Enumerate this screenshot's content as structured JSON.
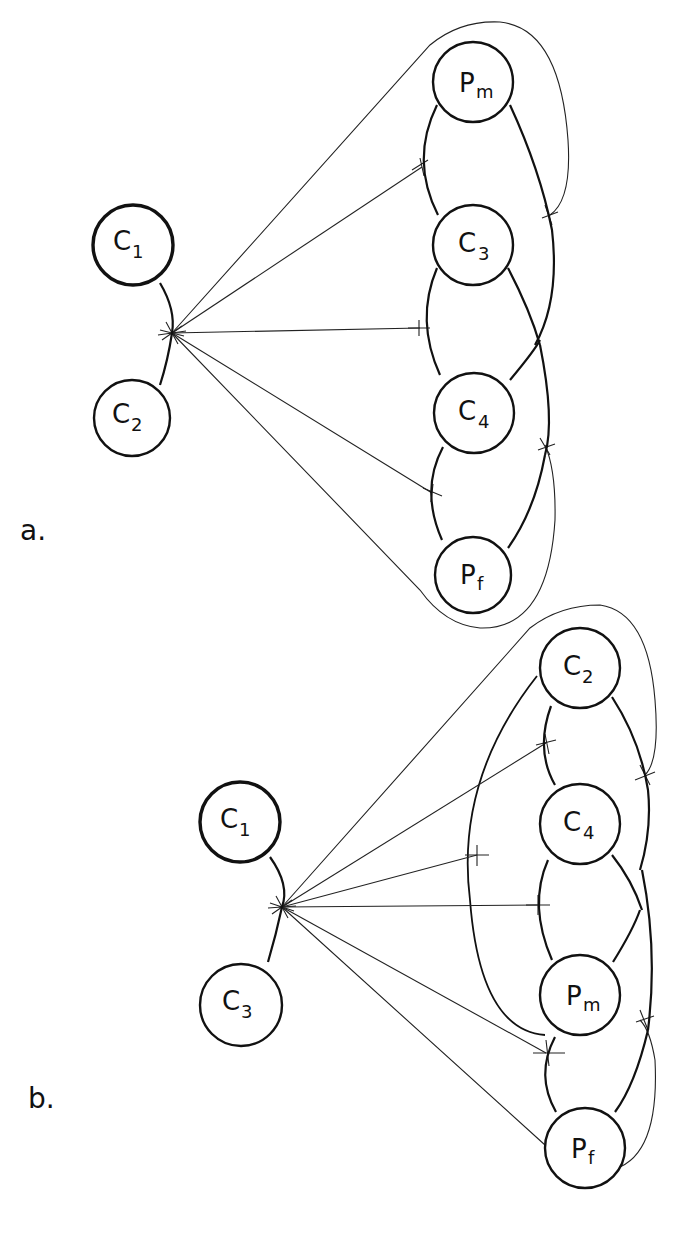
{
  "panels": [
    {
      "label": "a.",
      "hub_nodes": [
        {
          "id": "C1",
          "main": "C",
          "sub": "1",
          "bold": true
        },
        {
          "id": "C2",
          "main": "C",
          "sub": "2",
          "bold": false
        }
      ],
      "chain_nodes": [
        {
          "id": "Pm",
          "main": "P",
          "sub": "m"
        },
        {
          "id": "C3",
          "main": "C",
          "sub": "3"
        },
        {
          "id": "C4",
          "main": "C",
          "sub": "4"
        },
        {
          "id": "Pf",
          "main": "P",
          "sub": "f"
        }
      ]
    },
    {
      "label": "b.",
      "hub_nodes": [
        {
          "id": "C1",
          "main": "C",
          "sub": "1",
          "bold": true
        },
        {
          "id": "C3",
          "main": "C",
          "sub": "3",
          "bold": false
        }
      ],
      "chain_nodes": [
        {
          "id": "C2",
          "main": "C",
          "sub": "2"
        },
        {
          "id": "C4",
          "main": "C",
          "sub": "4"
        },
        {
          "id": "Pm",
          "main": "P",
          "sub": "m"
        },
        {
          "id": "Pf",
          "main": "P",
          "sub": "f"
        }
      ]
    }
  ]
}
